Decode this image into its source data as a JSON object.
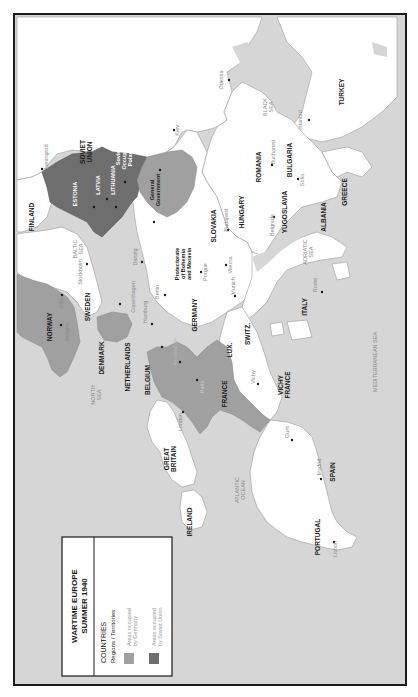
{
  "map": {
    "orientation": "rotated-90-ccw",
    "colors": {
      "sea": "#d6d6d6",
      "land": "#ffffff",
      "occupied_by_germany": "#a0a0a0",
      "occupied_by_soviet_union": "#6e6e6e",
      "border": "#9a9a9a",
      "frame": "#1a1a1a"
    }
  },
  "legend": {
    "title_line1": "WARTIME EUROPE",
    "title_line2": "SUMMER 1940",
    "countries_label": "COUNTRIES",
    "regions_label": "Regions / Territories",
    "items": [
      {
        "label_line1": "Areas occupied",
        "label_line2": "by Germany",
        "color": "#a0a0a0"
      },
      {
        "label_line1": "Areas occupied",
        "label_line2": "by Soviet Union",
        "color": "#6e6e6e"
      }
    ]
  },
  "countries": {
    "soviet_union": [
      "SOVIET",
      "UNION"
    ],
    "finland": "FINLAND",
    "estonia": "ESTONIA",
    "latvia": "LATVIA",
    "lithuania": "LITHUANIA",
    "soviet_occupied_poland": [
      "Soviet",
      "Occupied",
      "Poland"
    ],
    "general_government": [
      "General",
      "Government"
    ],
    "sweden": "SWEDEN",
    "norway": "NORWAY",
    "denmark": "DENMARK",
    "netherlands": "NETHERLANDS",
    "belgium": "BELGIUM",
    "luxembourg": "LUX.",
    "france": "FRANCE",
    "vichy_france": [
      "VICHY",
      "FRANCE"
    ],
    "germany": "GERMANY",
    "protectorate": [
      "Protectorate",
      "of Bohemia",
      "and Moravia"
    ],
    "slovakia": "SLOVAKIA",
    "hungary": "HUNGARY",
    "romania": "ROMANIA",
    "bulgaria": "BULGARIA",
    "yugoslavia": "YUGOSLAVIA",
    "albania": "ALBANIA",
    "greece": "GREECE",
    "turkey": "TURKEY",
    "italy": "ITALY",
    "switzerland": "SWITZ.",
    "spain": "SPAIN",
    "portugal": "PORTUGAL",
    "great_britain": [
      "GREAT",
      "BRITAIN"
    ],
    "ireland": "IRELAND"
  },
  "seas": {
    "baltic": [
      "BALTIC",
      "SEA"
    ],
    "north": [
      "NORTH",
      "SEA"
    ],
    "black": [
      "BLACK",
      "SEA"
    ],
    "adriatic": [
      "ADRIATIC",
      "SEA"
    ],
    "atlantic": [
      "ATLANTIC",
      "OCEAN"
    ],
    "mediterranean": "MEDITERRANEAN SEA"
  },
  "cities": {
    "leningrad": "Leningrad",
    "kiev": "Kiev",
    "odessa": "Odessa",
    "istanbul": "Istanbul",
    "bucharest": "Bucharest",
    "sofia": "Sofia",
    "belgrade": "Belgrade",
    "budapest": "Budapest",
    "vienna": "Vienna",
    "prague": "Prague",
    "munich": "Munich",
    "berlin": "Berlin",
    "hamburg": "Hamburg",
    "danzig": "Danzig",
    "copenhagen": "Copenhagen",
    "stockholm": "Stockholm",
    "oslo": "Oslo",
    "bergen": "Bergen",
    "amsterdam": "Amsterdam",
    "brussels": "Brussels",
    "paris": "Paris",
    "vichy": "Vichy",
    "london": "London",
    "guns": "Gurs",
    "madrid": "Madrid",
    "lisbon": "Lisbon",
    "rome": "Rome",
    "warsaw": "Warsaw",
    "riga": "Riga",
    "kaunas": "Kaunas",
    "vilnius": "Vilnius",
    "tallinn": "Tallinn",
    "lvov": "Lvov",
    "krakow": "Krakow"
  }
}
